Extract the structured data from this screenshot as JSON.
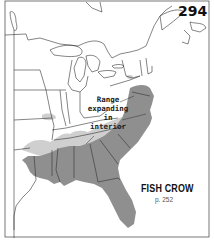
{
  "map": {
    "number": "294",
    "species": "FISH CROW",
    "page_ref": "p. 252",
    "annotation_lines": [
      "Range",
      "expanding",
      "in",
      "interior"
    ],
    "legend": {
      "dark_gray": "Year-round range",
      "light_gray": "Expanding interior range"
    },
    "colors": {
      "resident_range": "#8c8c8c",
      "expanding_range": "#c8c8c8",
      "border_lines": "#333333",
      "background": "#ffffff"
    }
  }
}
